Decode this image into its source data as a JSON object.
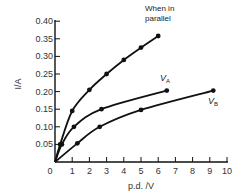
{
  "chart_data": {
    "type": "line",
    "title": "",
    "xlabel": "p.d. /V",
    "ylabel": "I/A",
    "xlim": [
      0,
      10
    ],
    "ylim": [
      0,
      0.4
    ],
    "grid": false,
    "x_ticks": [
      0,
      1,
      2,
      3,
      4,
      5,
      6,
      7,
      8,
      9,
      10
    ],
    "x_tick_labels": [
      "0",
      "1",
      "2",
      "3",
      "4",
      "5",
      "6",
      "7",
      "8",
      "9",
      "10"
    ],
    "y_ticks": [
      0.05,
      0.1,
      0.15,
      0.2,
      0.25,
      0.3,
      0.35,
      0.4
    ],
    "y_tick_labels": [
      "0.05",
      "0.10",
      "0.15",
      "0.20",
      "0.25",
      "0.30",
      "0.35",
      "0.40"
    ],
    "origin_label": "0",
    "series": [
      {
        "name": "When in parallel",
        "label_lines": [
          "When in",
          "parallel"
        ],
        "points": [
          [
            0,
            0
          ],
          [
            0.3,
            0.05
          ],
          [
            1.0,
            0.145
          ],
          [
            2.0,
            0.205
          ],
          [
            3.0,
            0.25
          ],
          [
            4.0,
            0.29
          ],
          [
            5.0,
            0.325
          ],
          [
            6.0,
            0.358
          ]
        ],
        "markers": [
          [
            0.3,
            0.05
          ],
          [
            1.0,
            0.145
          ],
          [
            2.0,
            0.205
          ],
          [
            3.0,
            0.25
          ],
          [
            4.0,
            0.29
          ],
          [
            5.0,
            0.325
          ],
          [
            6.0,
            0.358
          ]
        ]
      },
      {
        "name": "V_A",
        "label_main": "V",
        "label_sub": "A",
        "points": [
          [
            0,
            0
          ],
          [
            0.4,
            0.05
          ],
          [
            1.1,
            0.1
          ],
          [
            2.7,
            0.15
          ],
          [
            6.5,
            0.203
          ]
        ],
        "markers": [
          [
            0.4,
            0.05
          ],
          [
            1.1,
            0.1
          ],
          [
            2.7,
            0.15
          ],
          [
            6.5,
            0.203
          ]
        ]
      },
      {
        "name": "V_B",
        "label_main": "V",
        "label_sub": "B",
        "points": [
          [
            0,
            0
          ],
          [
            1.3,
            0.053
          ],
          [
            2.6,
            0.1
          ],
          [
            5.0,
            0.148
          ],
          [
            9.2,
            0.203
          ]
        ],
        "markers": [
          [
            1.3,
            0.053
          ],
          [
            2.6,
            0.1
          ],
          [
            5.0,
            0.148
          ],
          [
            9.2,
            0.203
          ]
        ]
      }
    ]
  }
}
